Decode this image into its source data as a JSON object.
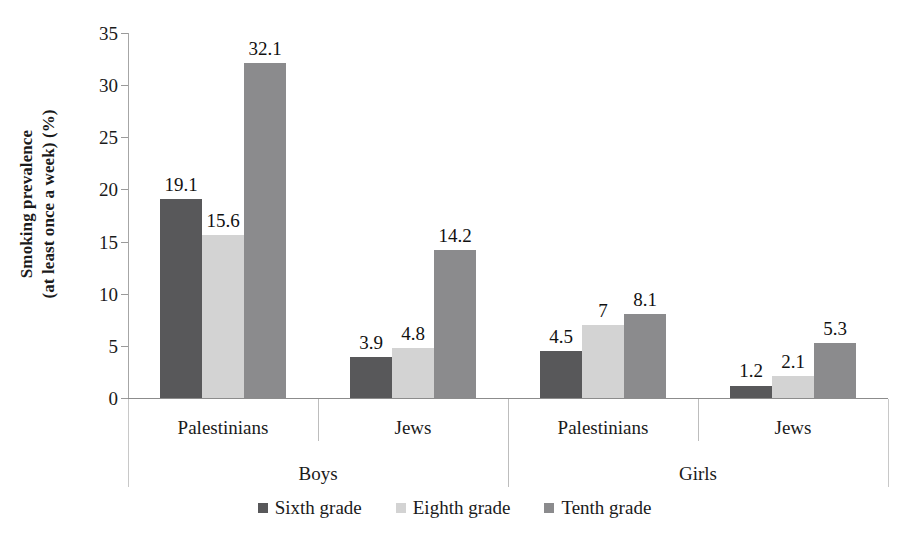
{
  "chart_data": {
    "type": "bar",
    "title": "",
    "xlabel": "",
    "ylabel": "Smoking prevalence (at least once a week) (%)",
    "ylabel_lines": [
      "Smoking prevalence",
      "(at least once a week) (%)"
    ],
    "ylim": [
      0,
      35
    ],
    "ytick_values": [
      0,
      5,
      10,
      15,
      20,
      25,
      30,
      35
    ],
    "ytick_labels": [
      "0",
      "5",
      "10",
      "15",
      "20",
      "25",
      "30",
      "35"
    ],
    "grid": false,
    "legend_position": "bottom",
    "categories": [
      "Palestinians",
      "Jews",
      "Palestinians",
      "Jews"
    ],
    "supergroups": [
      {
        "label": "Boys",
        "span": 2
      },
      {
        "label": "Girls",
        "span": 2
      }
    ],
    "series": [
      {
        "name": "Sixth grade",
        "color": "#58585a",
        "values": [
          19.1,
          3.9,
          4.5,
          1.2
        ],
        "labels": [
          "19.1",
          "3.9",
          "4.5",
          "1.2"
        ]
      },
      {
        "name": "Eighth grade",
        "color": "#d3d3d3",
        "values": [
          15.6,
          4.8,
          7,
          2.1
        ],
        "labels": [
          "15.6",
          "4.8",
          "7",
          "2.1"
        ]
      },
      {
        "name": "Tenth grade",
        "color": "#8b8b8d",
        "values": [
          32.1,
          14.2,
          8.1,
          5.3
        ],
        "labels": [
          "32.1",
          "14.2",
          "8.1",
          "5.3"
        ]
      }
    ]
  },
  "legend": {
    "items": [
      {
        "label": "Sixth grade",
        "color": "#58585a"
      },
      {
        "label": "Eighth grade",
        "color": "#d3d3d3"
      },
      {
        "label": "Tenth grade",
        "color": "#8b8b8d"
      }
    ]
  },
  "axis": {
    "y_title_line1": "Smoking prevalence",
    "y_title_line2": "(at least once a week) (%)"
  }
}
